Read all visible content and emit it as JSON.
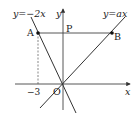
{
  "diagram": {
    "type": "coordinate-geometry",
    "labels": {
      "line1": "y=−2x",
      "line2": "y=ax",
      "y_axis": "y",
      "x_axis": "x",
      "origin": "O",
      "point_a": "A",
      "point_b": "B",
      "point_p": "P",
      "tick_minus3": "−3"
    },
    "colors": {
      "line": "#333333",
      "dashed": "#555555",
      "text": "#222222"
    }
  }
}
